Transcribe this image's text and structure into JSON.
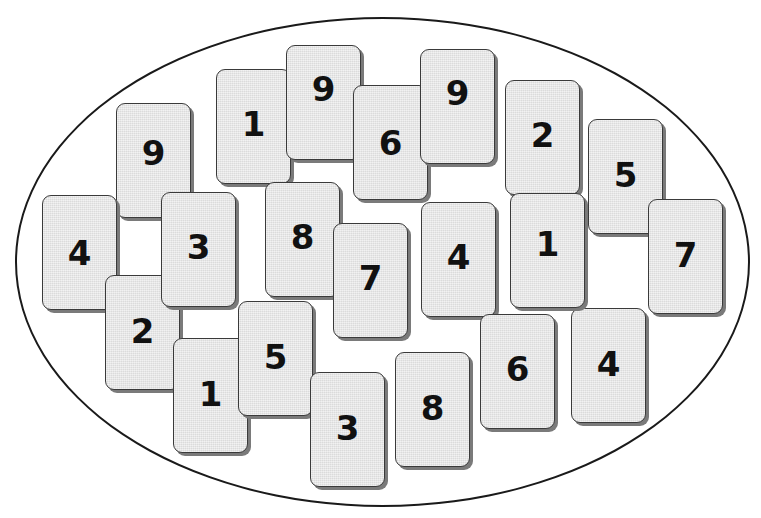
{
  "scene": {
    "description": "Set of numbered cards inside an oval",
    "card_count": 24
  },
  "cards": [
    {
      "value": "9",
      "x": 116,
      "y": 103,
      "z": 1,
      "num_dy": -8
    },
    {
      "value": "4",
      "x": 42,
      "y": 195,
      "z": 1,
      "num_dy": 0
    },
    {
      "value": "2",
      "x": 105,
      "y": 275,
      "z": 2,
      "num_dy": -2
    },
    {
      "value": "3",
      "x": 161,
      "y": 192,
      "z": 2,
      "num_dy": -3
    },
    {
      "value": "1",
      "x": 216,
      "y": 69,
      "z": 1,
      "num_dy": -3
    },
    {
      "value": "9",
      "x": 286,
      "y": 45,
      "z": 2,
      "num_dy": -14
    },
    {
      "value": "6",
      "x": 353,
      "y": 85,
      "z": 3,
      "num_dy": 0
    },
    {
      "value": "9",
      "x": 420,
      "y": 49,
      "z": 4,
      "num_dy": -14
    },
    {
      "value": "2",
      "x": 505,
      "y": 80,
      "z": 1,
      "num_dy": -3
    },
    {
      "value": "1",
      "x": 510,
      "y": 193,
      "z": 2,
      "num_dy": -7
    },
    {
      "value": "5",
      "x": 588,
      "y": 119,
      "z": 1,
      "num_dy": -2
    },
    {
      "value": "7",
      "x": 648,
      "y": 199,
      "z": 2,
      "num_dy": -2
    },
    {
      "value": "8",
      "x": 265,
      "y": 182,
      "z": 1,
      "num_dy": -3
    },
    {
      "value": "7",
      "x": 333,
      "y": 223,
      "z": 2,
      "num_dy": -3
    },
    {
      "value": "4",
      "x": 421,
      "y": 202,
      "z": 1,
      "num_dy": -3
    },
    {
      "value": "1",
      "x": 173,
      "y": 338,
      "z": 3,
      "num_dy": -2
    },
    {
      "value": "5",
      "x": 238,
      "y": 301,
      "z": 4,
      "num_dy": -2
    },
    {
      "value": "3",
      "x": 310,
      "y": 372,
      "z": 5,
      "num_dy": -2
    },
    {
      "value": "8",
      "x": 395,
      "y": 352,
      "z": 1,
      "num_dy": -2
    },
    {
      "value": "6",
      "x": 480,
      "y": 314,
      "z": 1,
      "num_dy": -3
    },
    {
      "value": "4",
      "x": 571,
      "y": 308,
      "z": 1,
      "num_dy": -2
    }
  ],
  "extra_cards_note": "All cards share identical style: light gray face, dark rounded border, drop shadow, bold black numeral"
}
